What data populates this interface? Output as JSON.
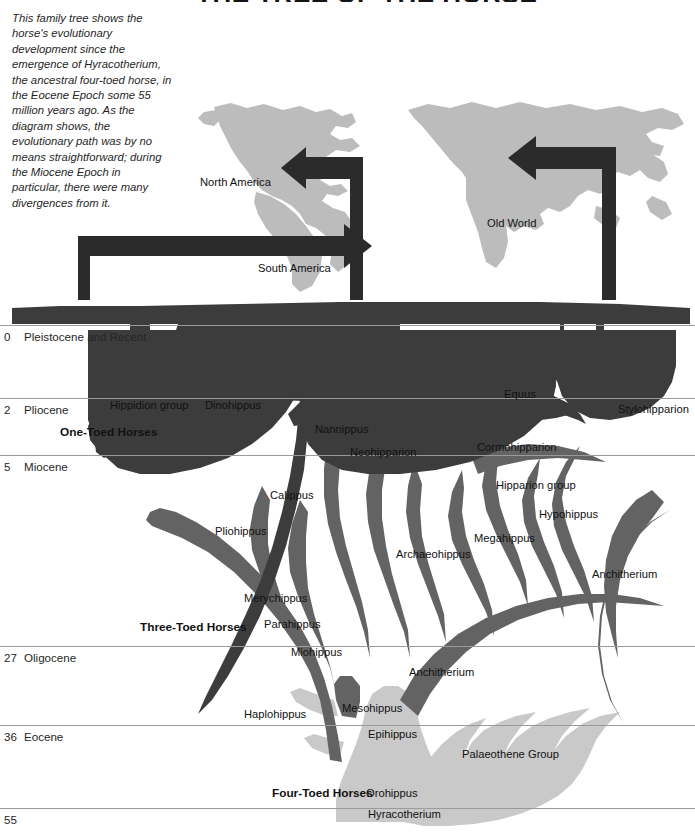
{
  "title": "THE TREE OF THE HORSE",
  "caption": {
    "text": "This family tree shows the horse's evolutionary development since the emergence of Hyracotherium, the ancestral four-toed horse, in the Eocene Epoch some 55 million years ago. As the diagram shows, the evolutionary path was by no means straightforward; during the Miocene Epoch in particular, there were many divergences from it."
  },
  "map": {
    "labels": [
      {
        "name": "north-america",
        "text": "North America",
        "x": 200,
        "y": 176
      },
      {
        "name": "south-america",
        "text": "South America",
        "x": 258,
        "y": 262
      },
      {
        "name": "old-world",
        "text": "Old World",
        "x": 487,
        "y": 217
      }
    ]
  },
  "timeline": {
    "unit_note": "millions of years ago",
    "rows": [
      {
        "mya": "0",
        "epoch": "Pleistocene and Recent",
        "y": 325,
        "line_width": 695
      },
      {
        "mya": "2",
        "epoch": "Pliocene",
        "y": 398,
        "line_width": 695
      },
      {
        "mya": "5",
        "epoch": "Miocene",
        "y": 455,
        "line_width": 695
      },
      {
        "mya": "27",
        "epoch": "Oligocene",
        "y": 646,
        "line_width": 695
      },
      {
        "mya": "36",
        "epoch": "Eocene",
        "y": 725,
        "line_width": 695
      },
      {
        "mya": "55",
        "epoch": "",
        "y": 808,
        "line_width": 695
      }
    ]
  },
  "groups": [
    {
      "label": "One-Toed Horses",
      "x": 60,
      "y": 425
    },
    {
      "label": "Three-Toed Horses",
      "x": 140,
      "y": 620
    },
    {
      "label": "Four-Toed Horses",
      "x": 272,
      "y": 786
    }
  ],
  "taxa": [
    {
      "name": "hippidion-group",
      "label": "Hippidion group",
      "x": 110,
      "y": 399
    },
    {
      "name": "dinohippus",
      "label": "Dinohippus",
      "x": 205,
      "y": 399
    },
    {
      "name": "equus",
      "label": "Equus",
      "x": 504,
      "y": 388
    },
    {
      "name": "stylohipparion",
      "label": "Stylohipparion",
      "x": 618,
      "y": 403
    },
    {
      "name": "nannippus",
      "label": "Nannippus",
      "x": 315,
      "y": 423
    },
    {
      "name": "neohipparion",
      "label": "Neohipparion",
      "x": 350,
      "y": 446
    },
    {
      "name": "cormohipparion",
      "label": "Cormohipparion",
      "x": 477,
      "y": 441
    },
    {
      "name": "hipparion-group",
      "label": "Hipparion group",
      "x": 496,
      "y": 479
    },
    {
      "name": "calippus",
      "label": "Calippus",
      "x": 270,
      "y": 489
    },
    {
      "name": "hypohippus",
      "label": "Hypohippus",
      "x": 539,
      "y": 508
    },
    {
      "name": "pliohippus",
      "label": "Pliohippus",
      "x": 215,
      "y": 525
    },
    {
      "name": "megahippus",
      "label": "Megahippus",
      "x": 474,
      "y": 532
    },
    {
      "name": "archaeohippus",
      "label": "Archaeohippus",
      "x": 396,
      "y": 548
    },
    {
      "name": "anchitherium-upper",
      "label": "Anchitherium",
      "x": 592,
      "y": 568
    },
    {
      "name": "merychippus",
      "label": "Merychippus",
      "x": 244,
      "y": 592
    },
    {
      "name": "parahippus",
      "label": "Parahippus",
      "x": 264,
      "y": 618
    },
    {
      "name": "miohippus",
      "label": "Miohippus",
      "x": 291,
      "y": 646
    },
    {
      "name": "anchitherium-lower",
      "label": "Anchitherium",
      "x": 409,
      "y": 666
    },
    {
      "name": "haplohippus",
      "label": "Haplohippus",
      "x": 244,
      "y": 708
    },
    {
      "name": "mesohippus",
      "label": "Mesohippus",
      "x": 342,
      "y": 702
    },
    {
      "name": "epihippus",
      "label": "Epihippus",
      "x": 368,
      "y": 728
    },
    {
      "name": "palaeothene-group",
      "label": "Palaeothene Group",
      "x": 462,
      "y": 748
    },
    {
      "name": "orohippus",
      "label": "Orohippus",
      "x": 366,
      "y": 787
    },
    {
      "name": "hyracotherium",
      "label": "Hyracotherium",
      "x": 368,
      "y": 808
    }
  ],
  "colors": {
    "tree_dark": "#3c3c3c",
    "tree_mid": "#636363",
    "tree_light": "#c9c9c9",
    "map_fill": "#bcbcbc",
    "arrow": "#2b2b2b",
    "rule": "#9a9a9a"
  }
}
